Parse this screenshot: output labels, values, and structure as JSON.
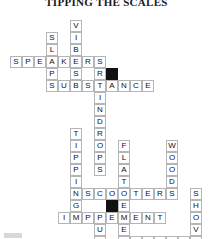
{
  "puzzle": {
    "title": "TIPPING THE SCALES",
    "grid": {
      "cols": 17,
      "rows": 22,
      "cell_size": 12,
      "origin_x": 10,
      "origin_y": 20,
      "block_color": "#111111",
      "line_color": "#b5b5b5",
      "fill_color": "#ffffff"
    },
    "entries": [
      {
        "answer": "VIBES",
        "direction": "down",
        "row": 0,
        "col": 5
      },
      {
        "answer": "SLAPS",
        "direction": "down",
        "row": 1,
        "col": 3
      },
      {
        "answer": "SPEAKERS",
        "direction": "across",
        "row": 3,
        "col": 0
      },
      {
        "answer": "RAINDROPS",
        "direction": "down",
        "row": 4,
        "col": 7
      },
      {
        "answer": "SUBSTANCE",
        "direction": "across",
        "row": 5,
        "col": 3
      },
      {
        "answer": "TIPPING",
        "direction": "down",
        "row": 9,
        "col": 5
      },
      {
        "answer": "FLATTENED",
        "direction": "down",
        "row": 10,
        "col": 9
      },
      {
        "answer": "WOOD",
        "direction": "down",
        "row": 10,
        "col": 13
      },
      {
        "answer": "SCOOTERS",
        "direction": "across",
        "row": 14,
        "col": 6
      },
      {
        "answer": "SHOVELS",
        "direction": "down",
        "row": 14,
        "col": 15
      },
      {
        "answer": "IMPLEMENT",
        "direction": "across",
        "row": 16,
        "col": 4
      },
      {
        "answer": "PUTTER",
        "direction": "down",
        "row": 16,
        "col": 7
      },
      {
        "answer": "ENZYMES",
        "direction": "across",
        "row": 18,
        "col": 9
      }
    ],
    "blocks": [
      {
        "row": 4,
        "col": 8
      },
      {
        "row": 15,
        "col": 8
      }
    ]
  }
}
